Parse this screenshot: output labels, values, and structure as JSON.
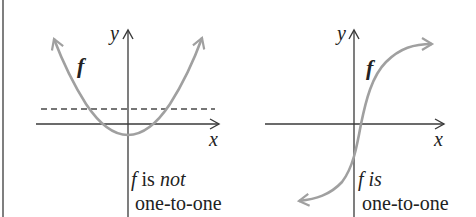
{
  "colors": {
    "axis": "#3a3a3a",
    "curve": "#a0a0a0",
    "dashed": "#4a4a4a",
    "border": "#555555",
    "background": "#ffffff"
  },
  "left_panel": {
    "y_axis_label": "y",
    "x_axis_label": "x",
    "function_label": "f",
    "caption_f": "f",
    "caption_is": " is ",
    "caption_not": "not",
    "caption_line2": "one-to-one",
    "curve_type": "parabola",
    "has_horizontal_test_line": true
  },
  "right_panel": {
    "y_axis_label": "y",
    "x_axis_label": "x",
    "function_label": "f",
    "caption_f": "f",
    "caption_is": " is",
    "caption_line2": "one-to-one",
    "curve_type": "s-curve (increasing)"
  }
}
